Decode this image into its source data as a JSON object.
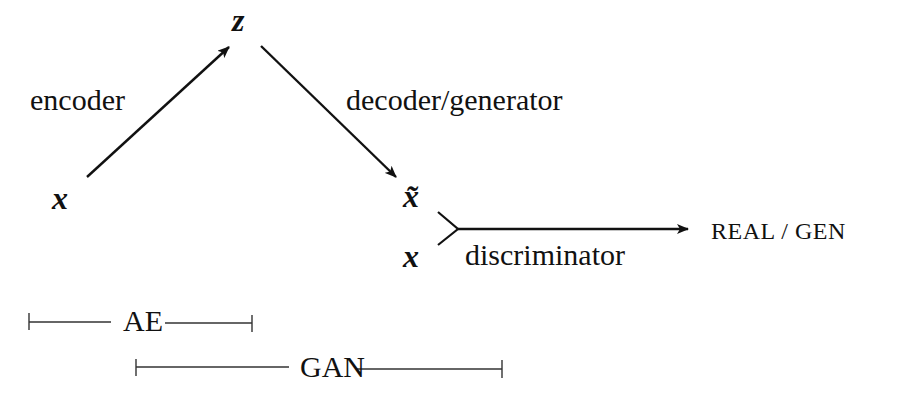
{
  "diagram": {
    "nodes": {
      "z": "z",
      "x_input": "x",
      "x_tilde": "x̃",
      "x_real": "x",
      "output": "REAL / GEN"
    },
    "edges": {
      "encoder": "encoder",
      "decoder": "decoder/generator",
      "discriminator": "discriminator"
    },
    "spans": {
      "ae": "AE",
      "gan": "GAN"
    },
    "colors": {
      "stroke": "#111111",
      "background": "#ffffff"
    }
  }
}
